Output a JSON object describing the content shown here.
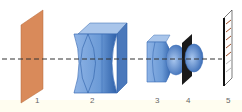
{
  "diagram": {
    "type": "optical-system",
    "optical_axis": "dashed horizontal line",
    "components": [
      {
        "index": "1",
        "label": "1",
        "description": "flat plate (orange/copper)",
        "color": "#d98a5a"
      },
      {
        "index": "2",
        "label": "2",
        "description": "cemented lens group: concave-convex-concave",
        "color": "#6b9ad6"
      },
      {
        "index": "3",
        "label": "3",
        "description": "plano-convex lens",
        "color": "#6b9ad6"
      },
      {
        "index": "4",
        "label": "4",
        "description": "aperture stop (black plate) with lens",
        "color": "#1a1a1a"
      },
      {
        "index": "5",
        "label": "5",
        "description": "film / ruled screen",
        "color": "#222222"
      }
    ],
    "colors": {
      "lens_blue": "#6b9ad6",
      "lens_dark": "#2d5fa8",
      "plate": "#d98a5a",
      "axis": "#333333",
      "footer_bg": "#fffdf0"
    }
  }
}
